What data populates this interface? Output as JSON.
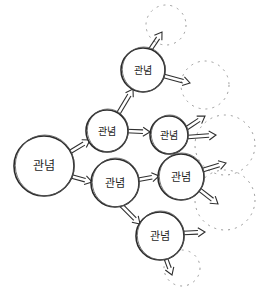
{
  "diagram": {
    "title": "",
    "style": "hand-drawn concept branching sketch",
    "colors": {
      "ink": "#2a2a2a",
      "ghost": "#9a9a9a",
      "background": "#ffffff"
    },
    "nodes": [
      {
        "id": "root",
        "label": "관념",
        "cx": 44,
        "cy": 166,
        "r": 30,
        "font": 12
      },
      {
        "id": "a",
        "label": "관념",
        "cx": 107,
        "cy": 131,
        "r": 21,
        "font": 10
      },
      {
        "id": "b",
        "label": "관념",
        "cx": 143,
        "cy": 70,
        "r": 22,
        "font": 10
      },
      {
        "id": "c",
        "label": "관념",
        "cx": 169,
        "cy": 135,
        "r": 19,
        "font": 10
      },
      {
        "id": "d",
        "label": "관념",
        "cx": 115,
        "cy": 183,
        "r": 24,
        "font": 11
      },
      {
        "id": "e",
        "label": "관념",
        "cx": 181,
        "cy": 177,
        "r": 23,
        "font": 11
      },
      {
        "id": "f",
        "label": "관념",
        "cx": 160,
        "cy": 236,
        "r": 24,
        "font": 11
      }
    ],
    "ghost_nodes": [
      {
        "id": "g1",
        "cx": 166,
        "cy": 25,
        "r": 20
      },
      {
        "id": "g2",
        "cx": 205,
        "cy": 85,
        "r": 24
      },
      {
        "id": "g3",
        "cx": 225,
        "cy": 145,
        "r": 30
      },
      {
        "id": "g4",
        "cx": 225,
        "cy": 200,
        "r": 30
      },
      {
        "id": "g5",
        "cx": 182,
        "cy": 268,
        "r": 18
      }
    ],
    "edges": [
      {
        "from": "root",
        "to": "a",
        "x1": 70,
        "y1": 152,
        "x2": 90,
        "y2": 140
      },
      {
        "from": "root",
        "to": "d",
        "x1": 70,
        "y1": 176,
        "x2": 92,
        "y2": 182
      },
      {
        "from": "a",
        "to": "b",
        "x1": 118,
        "y1": 114,
        "x2": 133,
        "y2": 89
      },
      {
        "from": "a",
        "to": "c",
        "x1": 126,
        "y1": 131,
        "x2": 150,
        "y2": 132
      },
      {
        "from": "d",
        "to": "e",
        "x1": 137,
        "y1": 180,
        "x2": 159,
        "y2": 176
      },
      {
        "from": "d",
        "to": "f",
        "x1": 120,
        "y1": 204,
        "x2": 140,
        "y2": 224
      },
      {
        "from": "b",
        "to": "g1",
        "x1": 150,
        "y1": 50,
        "x2": 162,
        "y2": 32
      },
      {
        "from": "b",
        "to": "g2",
        "x1": 164,
        "y1": 76,
        "x2": 190,
        "y2": 83
      },
      {
        "from": "c",
        "to": "g3",
        "x1": 187,
        "y1": 128,
        "x2": 205,
        "y2": 116
      },
      {
        "from": "c",
        "to": "g3b",
        "x1": 188,
        "y1": 137,
        "x2": 216,
        "y2": 135
      },
      {
        "from": "e",
        "to": "g4",
        "x1": 203,
        "y1": 170,
        "x2": 226,
        "y2": 163
      },
      {
        "from": "e",
        "to": "g4b",
        "x1": 200,
        "y1": 190,
        "x2": 218,
        "y2": 204
      },
      {
        "from": "f",
        "to": "g5",
        "x1": 183,
        "y1": 233,
        "x2": 205,
        "y2": 232
      },
      {
        "from": "f",
        "to": "g5b",
        "x1": 166,
        "y1": 259,
        "x2": 172,
        "y2": 275
      }
    ]
  }
}
